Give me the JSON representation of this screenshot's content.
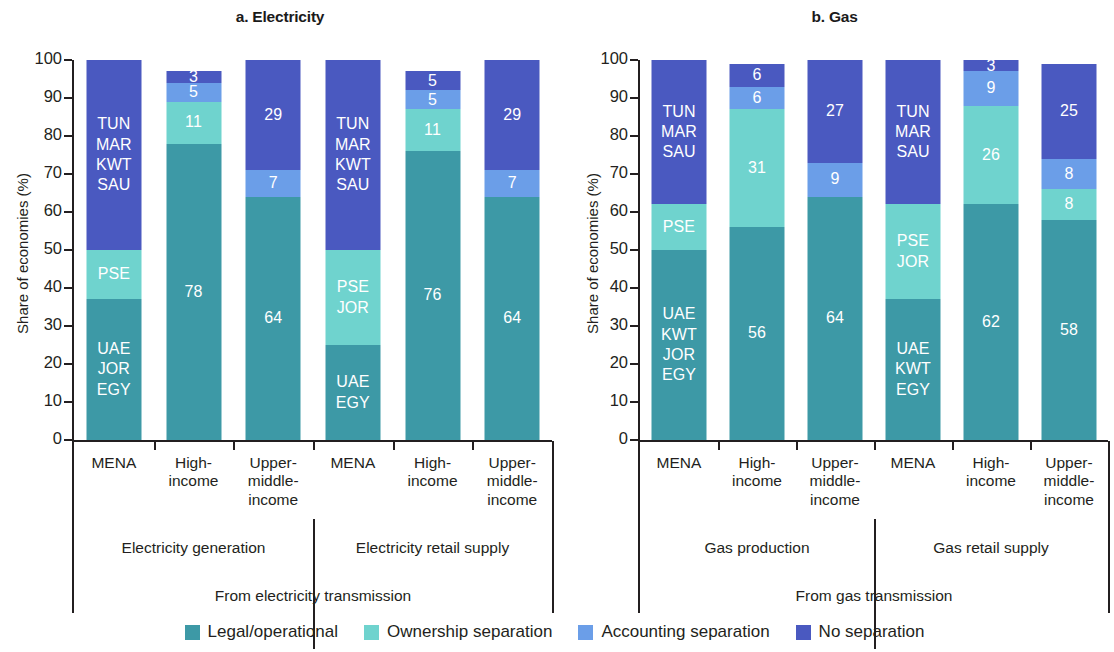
{
  "colors": {
    "legal_operational": "#3d99a6",
    "ownership_separation": "#6fd3ce",
    "accounting_separation": "#6b9ee8",
    "no_separation": "#4a59c0",
    "axis": "#231f20",
    "background": "#ffffff"
  },
  "legend": {
    "items": [
      {
        "label": "Legal/operational",
        "color_key": "legal_operational"
      },
      {
        "label": "Ownership separation",
        "color_key": "ownership_separation"
      },
      {
        "label": "Accounting separation",
        "color_key": "accounting_separation"
      },
      {
        "label": "No separation",
        "color_key": "no_separation"
      }
    ]
  },
  "panels": {
    "a": {
      "title": "a. Electricity",
      "ylabel": "Share of economies (%)",
      "yticks": [
        "0",
        "10",
        "20",
        "30",
        "40",
        "50",
        "60",
        "70",
        "80",
        "90",
        "100"
      ],
      "categories": [
        "MENA",
        "High-\nincome",
        "Upper-\nmiddle-\nincome",
        "MENA",
        "High-\nincome",
        "Upper-\nmiddle-\nincome"
      ],
      "groups": [
        "Electricity generation",
        "Electricity retail supply"
      ],
      "supergroup": "From electricity transmission"
    },
    "b": {
      "title": "b. Gas",
      "ylabel": "Share of economies (%)",
      "yticks": [
        "0",
        "10",
        "20",
        "30",
        "40",
        "50",
        "60",
        "70",
        "80",
        "90",
        "100"
      ],
      "categories": [
        "MENA",
        "High-\nincome",
        "Upper-\nmiddle-\nincome",
        "MENA",
        "High-\nincome",
        "Upper-\nmiddle-\nincome"
      ],
      "groups": [
        "Gas production",
        "Gas retail supply"
      ],
      "supergroup": "From gas transmission"
    }
  },
  "chart_data": {
    "type": "bar",
    "subtype": "stacked-bar",
    "ylabel": "Share of economies (%)",
    "xlabel": "",
    "ylim": [
      0,
      100
    ],
    "grid": false,
    "legend_position": "bottom",
    "series_order": [
      "Legal/operational",
      "Ownership separation",
      "Accounting separation",
      "No separation"
    ],
    "panels": [
      {
        "key": "a",
        "title": "a. Electricity",
        "supergroup": "From electricity transmission",
        "groups": [
          {
            "name": "Electricity generation",
            "bars": [
              {
                "category": "MENA",
                "segments": [
                  {
                    "series": "Legal/operational",
                    "value": 37,
                    "label": "UAE\nJOR\nEGY"
                  },
                  {
                    "series": "Ownership separation",
                    "value": 13,
                    "label": "PSE"
                  },
                  {
                    "series": "Accounting separation",
                    "value": 0,
                    "label": ""
                  },
                  {
                    "series": "No separation",
                    "value": 50,
                    "label": "TUN\nMAR\nKWT\nSAU"
                  }
                ]
              },
              {
                "category": "High-income",
                "segments": [
                  {
                    "series": "Legal/operational",
                    "value": 78,
                    "label": "78"
                  },
                  {
                    "series": "Ownership separation",
                    "value": 11,
                    "label": "11"
                  },
                  {
                    "series": "Accounting separation",
                    "value": 5,
                    "label": "5"
                  },
                  {
                    "series": "No separation",
                    "value": 3,
                    "label": "3"
                  }
                ]
              },
              {
                "category": "Upper-middle-income",
                "segments": [
                  {
                    "series": "Legal/operational",
                    "value": 64,
                    "label": "64"
                  },
                  {
                    "series": "Ownership separation",
                    "value": 0,
                    "label": ""
                  },
                  {
                    "series": "Accounting separation",
                    "value": 7,
                    "label": "7"
                  },
                  {
                    "series": "No separation",
                    "value": 29,
                    "label": "29"
                  }
                ]
              }
            ]
          },
          {
            "name": "Electricity retail supply",
            "bars": [
              {
                "category": "MENA",
                "segments": [
                  {
                    "series": "Legal/operational",
                    "value": 25,
                    "label": "UAE\nEGY"
                  },
                  {
                    "series": "Ownership separation",
                    "value": 25,
                    "label": "PSE\nJOR"
                  },
                  {
                    "series": "Accounting separation",
                    "value": 0,
                    "label": ""
                  },
                  {
                    "series": "No separation",
                    "value": 50,
                    "label": "TUN\nMAR\nKWT\nSAU"
                  }
                ]
              },
              {
                "category": "High-income",
                "segments": [
                  {
                    "series": "Legal/operational",
                    "value": 76,
                    "label": "76"
                  },
                  {
                    "series": "Ownership separation",
                    "value": 11,
                    "label": "11"
                  },
                  {
                    "series": "Accounting separation",
                    "value": 5,
                    "label": "5"
                  },
                  {
                    "series": "No separation",
                    "value": 5,
                    "label": "5"
                  }
                ]
              },
              {
                "category": "Upper-middle-income",
                "segments": [
                  {
                    "series": "Legal/operational",
                    "value": 64,
                    "label": "64"
                  },
                  {
                    "series": "Ownership separation",
                    "value": 0,
                    "label": ""
                  },
                  {
                    "series": "Accounting separation",
                    "value": 7,
                    "label": "7"
                  },
                  {
                    "series": "No separation",
                    "value": 29,
                    "label": "29"
                  }
                ]
              }
            ]
          }
        ]
      },
      {
        "key": "b",
        "title": "b. Gas",
        "supergroup": "From gas transmission",
        "groups": [
          {
            "name": "Gas production",
            "bars": [
              {
                "category": "MENA",
                "segments": [
                  {
                    "series": "Legal/operational",
                    "value": 50,
                    "label": "UAE\nKWT\nJOR\nEGY"
                  },
                  {
                    "series": "Ownership separation",
                    "value": 12,
                    "label": "PSE"
                  },
                  {
                    "series": "Accounting separation",
                    "value": 0,
                    "label": ""
                  },
                  {
                    "series": "No separation",
                    "value": 38,
                    "label": "TUN\nMAR\nSAU"
                  }
                ]
              },
              {
                "category": "High-income",
                "segments": [
                  {
                    "series": "Legal/operational",
                    "value": 56,
                    "label": "56"
                  },
                  {
                    "series": "Ownership separation",
                    "value": 31,
                    "label": "31"
                  },
                  {
                    "series": "Accounting separation",
                    "value": 6,
                    "label": "6"
                  },
                  {
                    "series": "No separation",
                    "value": 6,
                    "label": "6"
                  }
                ]
              },
              {
                "category": "Upper-middle-income",
                "segments": [
                  {
                    "series": "Legal/operational",
                    "value": 64,
                    "label": "64"
                  },
                  {
                    "series": "Ownership separation",
                    "value": 0,
                    "label": ""
                  },
                  {
                    "series": "Accounting separation",
                    "value": 9,
                    "label": "9"
                  },
                  {
                    "series": "No separation",
                    "value": 27,
                    "label": "27"
                  }
                ]
              }
            ]
          },
          {
            "name": "Gas retail supply",
            "bars": [
              {
                "category": "MENA",
                "segments": [
                  {
                    "series": "Legal/operational",
                    "value": 37,
                    "label": "UAE\nKWT\nEGY"
                  },
                  {
                    "series": "Ownership separation",
                    "value": 25,
                    "label": "PSE\nJOR"
                  },
                  {
                    "series": "Accounting separation",
                    "value": 0,
                    "label": ""
                  },
                  {
                    "series": "No separation",
                    "value": 38,
                    "label": "TUN\nMAR\nSAU"
                  }
                ]
              },
              {
                "category": "High-income",
                "segments": [
                  {
                    "series": "Legal/operational",
                    "value": 62,
                    "label": "62"
                  },
                  {
                    "series": "Ownership separation",
                    "value": 26,
                    "label": "26"
                  },
                  {
                    "series": "Accounting separation",
                    "value": 9,
                    "label": "9"
                  },
                  {
                    "series": "No separation",
                    "value": 3,
                    "label": "3"
                  }
                ]
              },
              {
                "category": "Upper-middle-income",
                "segments": [
                  {
                    "series": "Legal/operational",
                    "value": 58,
                    "label": "58"
                  },
                  {
                    "series": "Ownership separation",
                    "value": 8,
                    "label": "8"
                  },
                  {
                    "series": "Accounting separation",
                    "value": 8,
                    "label": "8"
                  },
                  {
                    "series": "No separation",
                    "value": 25,
                    "label": "25"
                  }
                ]
              }
            ]
          }
        ]
      }
    ]
  }
}
